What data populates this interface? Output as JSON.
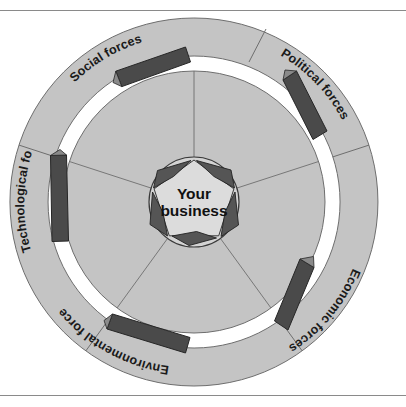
{
  "page": {
    "header_fragment": "",
    "background_color": "#ffffff",
    "rule_color": "#8a8a8a"
  },
  "diagram": {
    "type": "concentric-forces-wheel",
    "title": "",
    "center": {
      "line1": "Your",
      "line2": "business",
      "shape": "pentagon",
      "fill_color": "#d3d3d3",
      "inward_arrow_color": "#4d4d4d",
      "inward_arrow_count": 5
    },
    "geometry": {
      "cx": 194,
      "cy": 202,
      "outer_radius": 184,
      "ring_inner_radius": 146,
      "gap_outer_radius": 146,
      "disc_radius": 131,
      "core_radius": 45,
      "segments": 5
    },
    "colors": {
      "ring_fill": "#c4c4c4",
      "disc_fill": "#c4c4c4",
      "gap_fill": "#ffffff",
      "stroke": "#6e6e6e",
      "bar_fill": "#4a4a4a",
      "bar_stroke": "#2b2b2b",
      "text": "#1a1a1a"
    },
    "forces": [
      {
        "id": "social",
        "label": "Social forces",
        "position": "top-left",
        "angle_deg": -56,
        "label_angle_deg": -56
      },
      {
        "id": "political",
        "label": "Political forces",
        "position": "upper-right",
        "angle_deg": -344,
        "label_angle_deg": 16
      },
      {
        "id": "economic",
        "label": "Economic forces",
        "position": "lower-right",
        "angle_deg": 88,
        "label_angle_deg": 88
      },
      {
        "id": "environmental",
        "label": "Environmental forces",
        "position": "bottom",
        "angle_deg": 160,
        "label_angle_deg": 160
      },
      {
        "id": "technological",
        "label": "Technological forces",
        "position": "left",
        "angle_deg": 232,
        "label_angle_deg": 232
      }
    ]
  }
}
